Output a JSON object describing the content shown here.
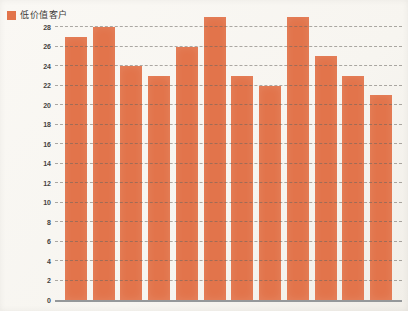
{
  "legend": {
    "label": "低价值客户",
    "swatch_color": "#e2744b"
  },
  "chart_data": {
    "type": "bar",
    "title": "",
    "xlabel": "",
    "ylabel": "",
    "categories": [
      "",
      "",
      "",
      "",
      "",
      "",
      "",
      "",
      "",
      "",
      "",
      ""
    ],
    "series": [
      {
        "name": "低价值客户",
        "values": [
          27,
          28,
          24,
          23,
          26,
          29,
          23,
          22,
          29,
          25,
          23,
          21
        ]
      }
    ],
    "ylim": [
      0,
      28
    ],
    "yticks": [
      0,
      2,
      4,
      6,
      8,
      10,
      12,
      14,
      16,
      18,
      20,
      22,
      24,
      26,
      28
    ],
    "grid": "horizontal-dashed",
    "legend_position": "top-left",
    "bar_color": "#e2744b",
    "gridline_color": "#6a6660",
    "axis_line_color": "#95989a"
  }
}
